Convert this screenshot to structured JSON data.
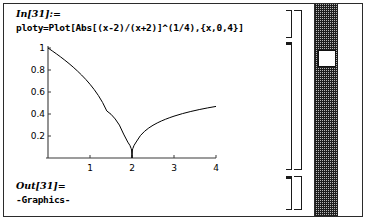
{
  "window": {
    "app": "Mathematica Notebook"
  },
  "input_cell": {
    "label": "In[31]:=",
    "code": "ploty=Plot[Abs[(x-2)/(x+2)]^(1/4),{x,0,4}]"
  },
  "output_cell": {
    "label": "Out[31]=",
    "text": "-Graphics-"
  },
  "scrollbar": {
    "thumb_label": "scroll-thumb"
  },
  "chart_data": {
    "type": "line",
    "title": "",
    "xlabel": "",
    "ylabel": "",
    "expression": "Abs[(x-2)/(x+2)]^(1/4)",
    "xlim": [
      0,
      4
    ],
    "ylim": [
      0,
      1
    ],
    "grid": false,
    "legend": "none",
    "xticks": [
      1,
      2,
      3,
      4
    ],
    "xtick_labels": [
      "1",
      "2",
      "3",
      "4"
    ],
    "yticks": [
      0.2,
      0.4,
      0.6,
      0.8,
      1
    ],
    "ytick_labels": [
      "0.2",
      "0.4",
      "0.6",
      "0.8",
      "1"
    ],
    "series": [
      {
        "name": "ploty",
        "color": "#000000",
        "x": [
          0.0,
          0.1,
          0.2,
          0.3,
          0.4,
          0.5,
          0.6,
          0.7,
          0.8,
          0.9,
          1.0,
          1.1,
          1.2,
          1.3,
          1.4,
          1.5,
          1.6,
          1.7,
          1.8,
          1.9,
          1.95,
          1.98,
          1.99,
          2.0,
          2.01,
          2.02,
          2.05,
          2.1,
          2.2,
          2.3,
          2.4,
          2.5,
          2.6,
          2.7,
          2.8,
          2.9,
          3.0,
          3.2,
          3.4,
          3.6,
          3.8,
          4.0
        ],
        "y": [
          1.0,
          0.974,
          0.947,
          0.9189,
          0.8895,
          0.8586,
          0.826,
          0.7913,
          0.7542,
          0.7142,
          0.6705,
          0.6222,
          0.5676,
          0.5043,
          0.4276,
          0.3976,
          0.355,
          0.2991,
          0.2176,
          0.1443,
          0.1147,
          0.0864,
          0.0727,
          0.0,
          0.0728,
          0.0866,
          0.1153,
          0.1456,
          0.2036,
          0.243,
          0.2731,
          0.2976,
          0.3185,
          0.3366,
          0.3526,
          0.3671,
          0.3803,
          0.4033,
          0.423,
          0.4402,
          0.4554,
          0.469
        ]
      }
    ]
  }
}
